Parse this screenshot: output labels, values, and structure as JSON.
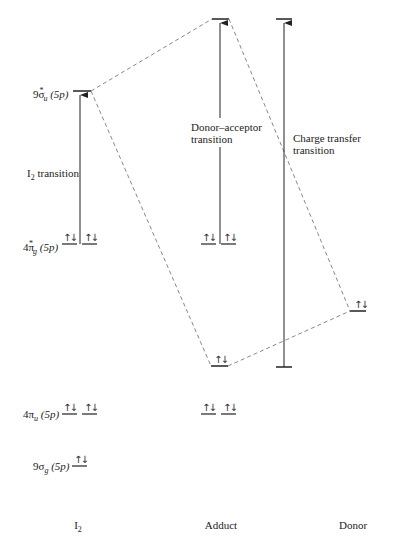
{
  "diagram": {
    "type": "molecular-orbital-energy-diagram",
    "columns": [
      {
        "id": "i2",
        "label": "I",
        "label_sub": "2"
      },
      {
        "id": "adduct",
        "label": "Adduct"
      },
      {
        "id": "donor",
        "label": "Donor"
      }
    ],
    "orbitals": {
      "sigma_u_star": {
        "base": "9σ",
        "sub": "u",
        "sup": "*",
        "tail": " (5p)"
      },
      "pi_g_star": {
        "base": "4π",
        "sub": "g",
        "sup": "*",
        "tail": " (5p)"
      },
      "pi_u": {
        "base": "4π",
        "sub": "u",
        "tail": " (5p)"
      },
      "sigma_g": {
        "base": "9σ",
        "sub": "g",
        "tail": " (5p)"
      }
    },
    "transitions": {
      "i2": {
        "line1": "I",
        "sub": "2",
        "line2": " transition"
      },
      "donor_acceptor": {
        "line1": "Donor–acceptor",
        "line2": "transition"
      },
      "charge_transfer": {
        "line1": "Charge transfer",
        "line2": "transition"
      }
    },
    "electron_pair_symbol": "↑↓",
    "line_color": "#222222",
    "dashed_color": "#888888"
  }
}
